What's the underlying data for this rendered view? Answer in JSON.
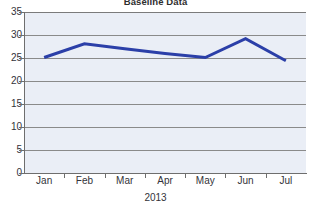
{
  "chart_data": {
    "type": "line",
    "title": "Baseline Data",
    "xlabel": "2013",
    "ylabel": "",
    "categories": [
      "Jan",
      "Feb",
      "Mar",
      "Apr",
      "May",
      "Jun",
      "Jul"
    ],
    "values": [
      25.1,
      28.1,
      27.0,
      26.0,
      25.1,
      29.2,
      24.4
    ],
    "series": [
      {
        "name": "Baseline Data",
        "values": [
          25.1,
          28.1,
          27.0,
          26.0,
          25.1,
          29.2,
          24.4
        ],
        "color": "#2b3fa8"
      }
    ],
    "ylim": [
      0,
      35
    ],
    "yticks": [
      0,
      5,
      10,
      15,
      20,
      25,
      30,
      35
    ],
    "ytick_labels": [
      "0",
      "5",
      "10",
      "15",
      "20",
      "25",
      "30",
      "35"
    ],
    "grid": true,
    "grid_axis": "y",
    "legend": false,
    "legend_position": "none",
    "plot_background": "#eaeef6",
    "gridline_color": "#8a8a8a",
    "axis_color": "#6e6e6e",
    "line_color": "#2b3fa8",
    "line_width": 3,
    "markers": false
  }
}
